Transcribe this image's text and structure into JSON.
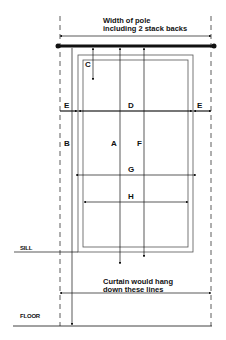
{
  "diagram": {
    "title_note": {
      "line1": "Width of pole",
      "line2": "including 2 stack backs"
    },
    "bottom_note": {
      "line1": "Curtain would hang",
      "line2": "down these lines"
    },
    "labels": {
      "sill": "SILL",
      "floor": "FLOOR"
    },
    "measurements": {
      "A": "A",
      "B": "B",
      "C": "C",
      "D": "D",
      "E_left": "E",
      "E_right": "E",
      "F": "F",
      "G": "G",
      "H": "H"
    },
    "colors": {
      "line": "#111111",
      "frame": "#555555",
      "dashed": "#333333",
      "background": "#ffffff"
    }
  }
}
